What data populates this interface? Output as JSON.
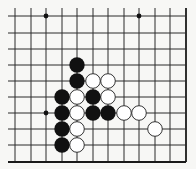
{
  "diagram": {
    "type": "go-board-fragment",
    "visible_edges": [
      "bottom",
      "right"
    ],
    "grid": {
      "cols_x": [
        15,
        31,
        46,
        62,
        77,
        93,
        108,
        124,
        139,
        155,
        170,
        186
      ],
      "rows_y": [
        16,
        33,
        49,
        65,
        81,
        97,
        113,
        129,
        145,
        162
      ],
      "line_color": "#2a2a2a",
      "edge_color": "#1a1a1a"
    },
    "star_points": [
      {
        "col": 2,
        "row": 0
      },
      {
        "col": 8,
        "row": 0
      },
      {
        "col": 2,
        "row": 6
      }
    ],
    "stones": {
      "black": [
        {
          "col": 4,
          "row": 3
        },
        {
          "col": 4,
          "row": 4
        },
        {
          "col": 3,
          "row": 5
        },
        {
          "col": 5,
          "row": 5
        },
        {
          "col": 3,
          "row": 6
        },
        {
          "col": 5,
          "row": 6
        },
        {
          "col": 6,
          "row": 6
        },
        {
          "col": 3,
          "row": 7
        },
        {
          "col": 3,
          "row": 8
        }
      ],
      "white": [
        {
          "col": 5,
          "row": 4
        },
        {
          "col": 6,
          "row": 4
        },
        {
          "col": 4,
          "row": 5
        },
        {
          "col": 6,
          "row": 5
        },
        {
          "col": 4,
          "row": 6
        },
        {
          "col": 7,
          "row": 6
        },
        {
          "col": 8,
          "row": 6
        },
        {
          "col": 4,
          "row": 7
        },
        {
          "col": 4,
          "row": 8
        },
        {
          "col": 9,
          "row": 7
        }
      ]
    },
    "colors": {
      "background": "#f7f7f5",
      "black_stone": "#111111",
      "white_stone_fill": "#ffffff",
      "white_stone_stroke": "#333333"
    }
  }
}
